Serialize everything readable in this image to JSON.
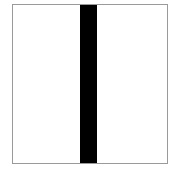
{
  "figure": {
    "frame": {
      "border_color": "#9a9a9a",
      "fill_color": "#ffffff"
    },
    "bar": {
      "orientation": "vertical",
      "color": "#000000"
    }
  }
}
